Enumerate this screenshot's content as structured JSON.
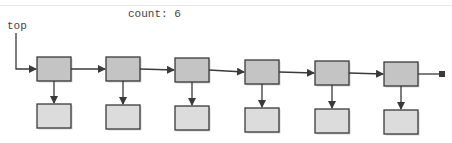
{
  "header": {
    "count_label": "count: 6"
  },
  "stack": {
    "top_label": "top",
    "count": 6,
    "colors": {
      "node_fill": "#c4c4c4",
      "data_fill": "#dcdcdc",
      "stroke": "#3a3a3a",
      "shadow": "#bbbbbb"
    },
    "nodes": [
      {
        "x": 37,
        "y": 57,
        "dx": 37,
        "dy": 104
      },
      {
        "x": 106,
        "y": 57,
        "dx": 106,
        "dy": 105
      },
      {
        "x": 175,
        "y": 58,
        "dx": 175,
        "dy": 106
      },
      {
        "x": 245,
        "y": 60,
        "dx": 245,
        "dy": 108
      },
      {
        "x": 315,
        "y": 61,
        "dx": 315,
        "dy": 109
      },
      {
        "x": 384,
        "y": 62,
        "dx": 384,
        "dy": 110
      }
    ],
    "null_terminator": {
      "x": 440,
      "y": 74
    }
  }
}
